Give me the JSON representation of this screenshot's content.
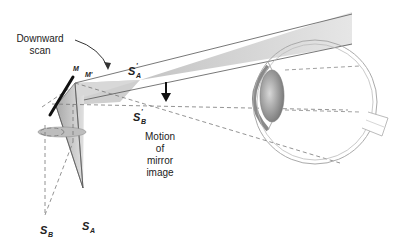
{
  "labels": {
    "downward_scan_line1": "Downward",
    "downward_scan_line2": "scan",
    "mirror_m": "M",
    "mirror_m_prime": "M'",
    "sa_prime_main": "S",
    "sa_prime_sub": "A",
    "sa_prime_mark": "'",
    "sb_prime_main": "S",
    "sb_prime_sub": "B",
    "sb_prime_mark": "'",
    "motion_line1": "Motion",
    "motion_line2": "of",
    "motion_line3": "mirror",
    "motion_line4": "image",
    "sb_main": "S",
    "sb_sub": "B",
    "sa_main": "S",
    "sa_sub": "A"
  },
  "colors": {
    "beam_fill": "#c8c8c8",
    "beam_stroke": "#555555",
    "mirror": "#111111",
    "dashed": "#777777",
    "eye_outline": "#999999",
    "lens_fill": "#9a9a9a"
  }
}
